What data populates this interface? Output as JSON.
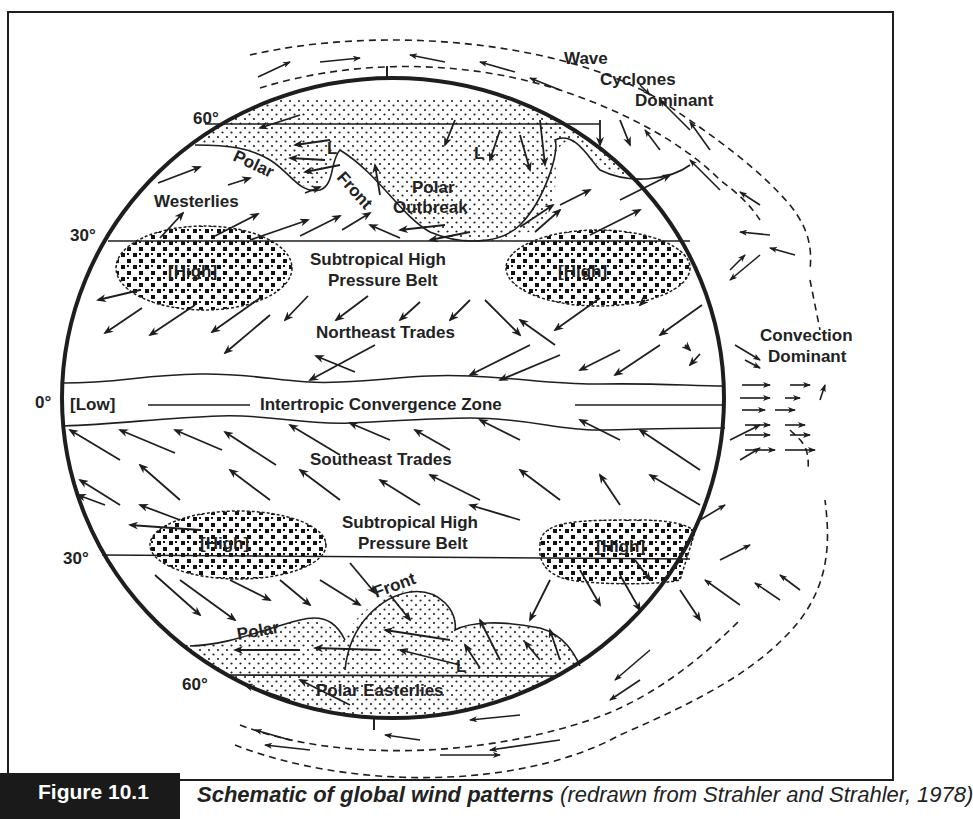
{
  "figure": {
    "number_label": "Figure 10.1",
    "caption_title": "Schematic of global wind patterns",
    "caption_source": "(redrawn from Strahler and Strahler, 1978)"
  },
  "latitudes": {
    "n60": "60°",
    "n30": "30°",
    "eq": "0°",
    "s30": "30°",
    "s60": "60°"
  },
  "labels": {
    "wave": "Wave",
    "cyclones": "Cyclones",
    "dominant_top": "Dominant",
    "polar_n": "Polar",
    "front_n": "Front",
    "westerlies": "Westerlies",
    "polar_outbreak_1": "Polar",
    "polar_outbreak_2": "Outbreak",
    "low_l": "L",
    "high": "[High]",
    "stp_1": "Subtropical High",
    "stp_2": "Pressure Belt",
    "ne_trades": "Northeast Trades",
    "low": "[Low]",
    "itcz": "Intertropic Convergence Zone",
    "se_trades": "Southeast Trades",
    "convection": "Convection",
    "dominant_right": "Dominant",
    "polar_s": "Polar",
    "front_s": "Front",
    "polar_easterlies": "Polar Easterlies"
  },
  "colors": {
    "ink": "#1e1e1e",
    "paper": "#ffffff"
  }
}
